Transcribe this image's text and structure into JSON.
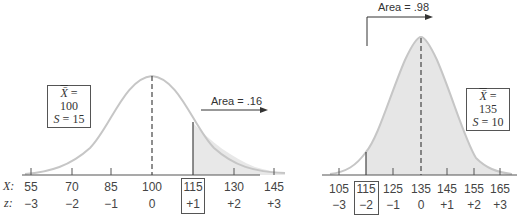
{
  "left_panel": {
    "stats": {
      "mean_label": "X̄",
      "mean_value": "= 100",
      "sd_label": "S",
      "sd_value": "= 15"
    },
    "area_label": "Area = .16",
    "row_labels": {
      "x": "X:",
      "z": "z:"
    },
    "x_values": [
      "55",
      "70",
      "85",
      "100",
      "115",
      "130",
      "145"
    ],
    "z_values": [
      "−3",
      "−2",
      "−1",
      "0",
      "+1",
      "+2",
      "+3"
    ],
    "highlighted_index": 4
  },
  "right_panel": {
    "stats": {
      "mean_label": "X̄",
      "mean_value": "= 135",
      "sd_label": "S",
      "sd_value": "= 10"
    },
    "area_label": "Area = .98",
    "x_values": [
      "105",
      "115",
      "125",
      "135",
      "145",
      "155",
      "165"
    ],
    "z_values": [
      "−3",
      "−2",
      "−1",
      "0",
      "+1",
      "+2",
      "+3"
    ],
    "highlighted_index": 1
  },
  "colors": {
    "curve": "#c8c8c8",
    "shade": "#e6e6e6",
    "axis": "#555555",
    "text": "#333333"
  }
}
